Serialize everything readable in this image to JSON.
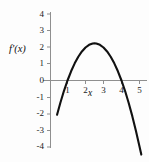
{
  "figure": {
    "background_color": "#fdfdfd",
    "width": 149,
    "height": 162
  },
  "chart_data": {
    "type": "line",
    "title": "",
    "subtitle": "",
    "xlabel": "x",
    "ylabel": "f'(x)",
    "grid": false,
    "legend": null,
    "curve_color": "#111111",
    "axis_color": "#8f8f8f",
    "xlim": [
      -0.2,
      5.3
    ],
    "ylim": [
      -4.4,
      4.3
    ],
    "xticks": [
      1,
      2,
      3,
      4,
      5
    ],
    "yticks": [
      4,
      3,
      2,
      1,
      0,
      -1,
      -2,
      -3,
      -4
    ],
    "xtick_labels": [
      "1",
      "2",
      "3",
      "4",
      "5"
    ],
    "ytick_labels": [
      "4",
      "3",
      "2",
      "1",
      "0",
      "-1",
      "-2",
      "-3",
      "-4"
    ],
    "function": "f'(x) = -(x-1)(x-4)",
    "roots": [
      1,
      4
    ],
    "vertex": [
      2.5,
      2.25
    ],
    "x": [
      0.42,
      0.6,
      0.8,
      1.0,
      1.2,
      1.4,
      1.6,
      1.8,
      2.0,
      2.2,
      2.4,
      2.5,
      2.6,
      2.8,
      3.0,
      3.2,
      3.4,
      3.6,
      3.8,
      4.0,
      4.2,
      4.4,
      4.6,
      4.8,
      5.0,
      5.1
    ],
    "y": [
      -2.08,
      -1.36,
      -0.64,
      0.0,
      0.56,
      1.04,
      1.44,
      1.76,
      2.0,
      2.16,
      2.24,
      2.25,
      2.24,
      2.16,
      2.0,
      1.76,
      1.44,
      1.04,
      0.56,
      0.0,
      -0.64,
      -1.36,
      -2.16,
      -3.04,
      -4.0,
      -4.49
    ]
  },
  "labels": {
    "y_axis_name": "f'(x)",
    "x_axis_name": "x"
  }
}
